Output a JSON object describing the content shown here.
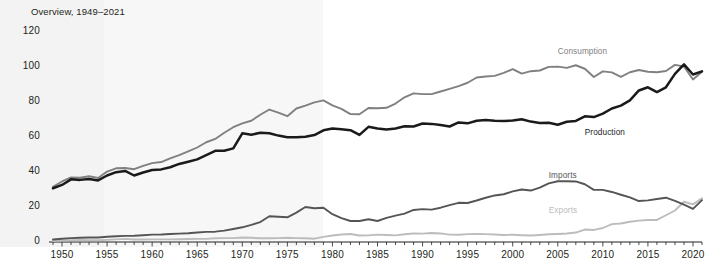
{
  "chart_data": {
    "type": "line",
    "title": "Overview, 1949–2021",
    "xlabel": "",
    "ylabel": "",
    "xlim": [
      1949,
      2021
    ],
    "ylim": [
      0,
      120
    ],
    "grid": false,
    "legend": "inline-annotations",
    "yticks": [
      "0",
      "20",
      "40",
      "60",
      "80",
      "100",
      "120"
    ],
    "ytick_values": [
      0,
      20,
      40,
      60,
      80,
      100,
      120
    ],
    "xticks": [
      "1950",
      "1955",
      "1960",
      "1965",
      "1970",
      "1975",
      "1980",
      "1985",
      "1990",
      "1995",
      "2000",
      "2005",
      "2010",
      "2015",
      "2020"
    ],
    "xtick_values": [
      1950,
      1955,
      1960,
      1965,
      1970,
      1975,
      1980,
      1985,
      1990,
      1995,
      2000,
      2005,
      2010,
      2015,
      2020
    ],
    "x": [
      1949,
      1950,
      1951,
      1952,
      1953,
      1954,
      1955,
      1956,
      1957,
      1958,
      1959,
      1960,
      1961,
      1962,
      1963,
      1964,
      1965,
      1966,
      1967,
      1968,
      1969,
      1970,
      1971,
      1972,
      1973,
      1974,
      1975,
      1976,
      1977,
      1978,
      1979,
      1980,
      1981,
      1982,
      1983,
      1984,
      1985,
      1986,
      1987,
      1988,
      1989,
      1990,
      1991,
      1992,
      1993,
      1994,
      1995,
      1996,
      1997,
      1998,
      1999,
      2000,
      2001,
      2002,
      2003,
      2004,
      2005,
      2006,
      2007,
      2008,
      2009,
      2010,
      2011,
      2012,
      2013,
      2014,
      2015,
      2016,
      2017,
      2018,
      2019,
      2020,
      2021
    ],
    "series": [
      {
        "name": "Consumption",
        "color": "#808080",
        "values": [
          31.6,
          34.6,
          36.9,
          36.7,
          37.6,
          36.6,
          40.2,
          42.1,
          42.3,
          41.6,
          43.5,
          45.1,
          45.7,
          47.8,
          49.6,
          51.8,
          54.0,
          57.0,
          58.9,
          62.4,
          65.6,
          67.8,
          69.3,
          72.7,
          75.7,
          73.9,
          71.9,
          76.3,
          77.9,
          79.8,
          80.9,
          78.1,
          76.1,
          73.1,
          73.0,
          76.6,
          76.4,
          76.7,
          79.1,
          82.7,
          84.9,
          84.5,
          84.5,
          86.0,
          87.5,
          89.1,
          91.0,
          94.0,
          94.6,
          94.9,
          96.6,
          98.8,
          96.2,
          97.6,
          98.0,
          100.1,
          100.2,
          99.5,
          101.0,
          99.0,
          94.3,
          97.5,
          96.9,
          94.4,
          97.0,
          98.3,
          97.3,
          97.0,
          97.7,
          101.2,
          100.3,
          92.9,
          97.3
        ]
      },
      {
        "name": "Production",
        "color": "#1a1a1a",
        "values": [
          30.7,
          32.6,
          35.8,
          35.5,
          36.0,
          35.2,
          38.0,
          39.9,
          40.6,
          38.0,
          39.7,
          41.1,
          41.5,
          42.7,
          44.6,
          45.9,
          47.2,
          49.6,
          52.1,
          52.1,
          53.5,
          62.1,
          61.3,
          62.4,
          62.1,
          60.8,
          59.9,
          59.9,
          60.2,
          61.1,
          63.8,
          64.8,
          64.4,
          63.9,
          61.2,
          65.8,
          64.9,
          64.3,
          64.9,
          66.1,
          66.0,
          67.7,
          67.5,
          66.9,
          66.0,
          68.3,
          67.8,
          69.3,
          69.7,
          69.3,
          69.2,
          69.4,
          70.1,
          68.8,
          68.0,
          68.1,
          67.0,
          68.7,
          69.2,
          71.8,
          71.4,
          73.4,
          76.3,
          77.9,
          80.9,
          86.6,
          88.4,
          85.7,
          88.4,
          96.1,
          101.5,
          95.7,
          97.5
        ]
      },
      {
        "name": "Imports",
        "color": "#555555",
        "values": [
          1.4,
          1.9,
          2.2,
          2.4,
          2.6,
          2.6,
          3.0,
          3.3,
          3.5,
          3.6,
          3.9,
          4.2,
          4.3,
          4.6,
          4.8,
          5.0,
          5.4,
          5.8,
          5.9,
          6.5,
          7.4,
          8.4,
          9.8,
          11.4,
          14.7,
          14.4,
          14.1,
          16.8,
          20.0,
          19.3,
          19.6,
          15.9,
          13.7,
          12.0,
          12.0,
          13.0,
          12.0,
          13.8,
          15.1,
          16.2,
          18.3,
          18.8,
          18.5,
          19.6,
          21.1,
          22.4,
          22.3,
          23.7,
          25.3,
          26.6,
          27.3,
          28.9,
          30.0,
          29.4,
          31.1,
          33.5,
          34.7,
          34.7,
          34.6,
          33.0,
          29.8,
          29.8,
          28.6,
          27.0,
          25.5,
          23.4,
          23.8,
          24.6,
          25.3,
          23.5,
          21.3,
          18.9,
          23.9
        ]
      },
      {
        "name": "Exports",
        "color": "#bcbcbc",
        "values": [
          0.6,
          0.8,
          1.0,
          1.1,
          1.0,
          1.0,
          1.2,
          1.5,
          1.8,
          1.4,
          1.4,
          1.5,
          1.5,
          1.5,
          1.6,
          1.7,
          1.8,
          1.8,
          2.1,
          2.2,
          2.2,
          2.6,
          2.4,
          2.1,
          2.1,
          2.2,
          2.4,
          2.2,
          2.1,
          1.9,
          2.9,
          3.7,
          4.3,
          4.6,
          3.7,
          3.8,
          4.2,
          4.0,
          3.8,
          4.4,
          4.9,
          4.8,
          5.1,
          4.9,
          4.2,
          4.1,
          4.5,
          4.6,
          4.5,
          4.3,
          4.0,
          4.1,
          3.9,
          3.7,
          4.0,
          4.4,
          4.6,
          4.9,
          5.4,
          7.1,
          6.9,
          8.0,
          10.2,
          10.6,
          11.6,
          12.2,
          12.6,
          12.6,
          15.3,
          18.0,
          23.0,
          21.5,
          25.0
        ]
      }
    ],
    "annotations": [
      {
        "text": "Consumption",
        "x": 2005,
        "y": 108,
        "color": "#808080"
      },
      {
        "text": "Production",
        "x": 2008,
        "y": 62,
        "color": "#1a1a1a"
      },
      {
        "text": "Imports",
        "x": 2004,
        "y": 37,
        "color": "#555555"
      },
      {
        "text": "Exports",
        "x": 2004,
        "y": 17,
        "color": "#bcbcbc"
      }
    ]
  }
}
